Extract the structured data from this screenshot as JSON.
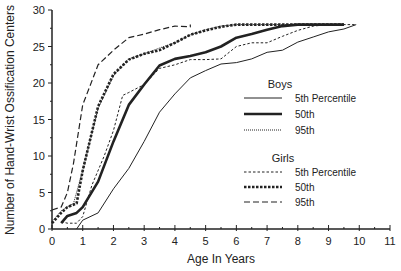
{
  "chart_data": {
    "type": "line",
    "title": "",
    "xlabel": "Age In Years",
    "ylabel": "Number of Hand-Wrist Ossification Centers",
    "xlim": [
      0,
      11
    ],
    "ylim": [
      0,
      30
    ],
    "x_ticks": [
      0,
      1,
      2,
      3,
      4,
      5,
      6,
      7,
      8,
      9,
      10,
      11
    ],
    "y_ticks": [
      0,
      5,
      10,
      15,
      20,
      25,
      30
    ],
    "grid": false,
    "legend": {
      "position": "right-center",
      "groups": [
        {
          "title": "Boys",
          "entries": [
            "5th Percentile",
            "50th",
            "95th"
          ]
        },
        {
          "title": "Girls",
          "entries": [
            "5th Percentile",
            "50th",
            "95th"
          ]
        }
      ]
    },
    "series": [
      {
        "name": "Boys 5th Percentile",
        "group": "Boys",
        "style": "solid-thin",
        "points": [
          [
            0.8,
            0
          ],
          [
            1.0,
            1.2
          ],
          [
            1.5,
            2.2
          ],
          [
            2.0,
            5.5
          ],
          [
            2.5,
            8.3
          ],
          [
            3.0,
            12.0
          ],
          [
            3.5,
            16.0
          ],
          [
            4.0,
            18.5
          ],
          [
            4.5,
            20.7
          ],
          [
            5.0,
            21.7
          ],
          [
            5.5,
            22.6
          ],
          [
            6.0,
            22.8
          ],
          [
            6.5,
            23.3
          ],
          [
            7.0,
            24.2
          ],
          [
            7.5,
            24.5
          ],
          [
            8.0,
            25.6
          ],
          [
            8.5,
            26.3
          ],
          [
            9.0,
            27.0
          ],
          [
            9.5,
            27.4
          ],
          [
            9.9,
            28.0
          ]
        ]
      },
      {
        "name": "Boys 50th",
        "group": "Boys",
        "style": "solid-thick",
        "points": [
          [
            0.3,
            0.8
          ],
          [
            0.5,
            1.8
          ],
          [
            0.8,
            2.2
          ],
          [
            1.0,
            3.0
          ],
          [
            1.5,
            6.5
          ],
          [
            2.0,
            12.0
          ],
          [
            2.5,
            17.0
          ],
          [
            3.0,
            19.8
          ],
          [
            3.5,
            22.4
          ],
          [
            4.0,
            23.3
          ],
          [
            4.5,
            23.7
          ],
          [
            5.0,
            24.2
          ],
          [
            5.5,
            25.0
          ],
          [
            6.0,
            26.2
          ],
          [
            6.5,
            26.7
          ],
          [
            7.0,
            27.3
          ],
          [
            7.5,
            27.8
          ],
          [
            8.0,
            28.0
          ],
          [
            9.0,
            28.0
          ],
          [
            9.5,
            28.0
          ]
        ]
      },
      {
        "name": "Boys 95th",
        "group": "Boys",
        "style": "dotted-thin",
        "points": [
          [
            0.0,
            1.0
          ],
          [
            0.3,
            2.5
          ],
          [
            0.7,
            3.5
          ],
          [
            1.0,
            8.0
          ],
          [
            1.5,
            16.5
          ],
          [
            2.0,
            21.0
          ],
          [
            2.5,
            23.3
          ],
          [
            3.0,
            24.0
          ],
          [
            3.5,
            24.8
          ],
          [
            4.0,
            25.5
          ],
          [
            4.5,
            26.6
          ],
          [
            5.0,
            27.3
          ],
          [
            5.5,
            27.8
          ],
          [
            6.0,
            28.0
          ],
          [
            7.0,
            28.0
          ],
          [
            8.0,
            28.0
          ],
          [
            9.0,
            28.0
          ]
        ]
      },
      {
        "name": "Girls 5th Percentile",
        "group": "Girls",
        "style": "dashed-thin",
        "points": [
          [
            0.3,
            1.0
          ],
          [
            0.5,
            0.8
          ],
          [
            0.8,
            0.8
          ],
          [
            1.0,
            1.7
          ],
          [
            1.3,
            6.0
          ],
          [
            1.7,
            10.0
          ],
          [
            2.0,
            13.5
          ],
          [
            2.3,
            18.3
          ],
          [
            2.5,
            18.7
          ],
          [
            3.0,
            19.8
          ],
          [
            3.5,
            22.0
          ],
          [
            4.0,
            22.5
          ],
          [
            4.5,
            23.2
          ],
          [
            5.0,
            23.2
          ],
          [
            5.5,
            23.3
          ],
          [
            6.0,
            25.0
          ],
          [
            6.5,
            25.5
          ],
          [
            7.0,
            25.5
          ],
          [
            7.5,
            26.4
          ],
          [
            8.0,
            27.2
          ],
          [
            8.5,
            27.8
          ],
          [
            9.0,
            28.0
          ],
          [
            9.5,
            28.0
          ],
          [
            9.9,
            28.0
          ]
        ]
      },
      {
        "name": "Girls 50th",
        "group": "Girls",
        "style": "dashed-thick",
        "points": [
          [
            0.0,
            0.8
          ],
          [
            0.3,
            2.2
          ],
          [
            0.5,
            3.0
          ],
          [
            0.8,
            3.5
          ],
          [
            1.0,
            8.0
          ],
          [
            1.5,
            16.8
          ],
          [
            2.0,
            21.2
          ],
          [
            2.5,
            23.2
          ],
          [
            3.0,
            24.0
          ],
          [
            3.5,
            24.5
          ],
          [
            4.0,
            25.5
          ],
          [
            4.5,
            26.6
          ],
          [
            5.0,
            27.2
          ],
          [
            5.5,
            27.7
          ],
          [
            6.0,
            28.0
          ],
          [
            7.0,
            28.0
          ],
          [
            8.0,
            28.0
          ],
          [
            9.0,
            28.0
          ],
          [
            9.5,
            28.0
          ]
        ]
      },
      {
        "name": "Girls 95th",
        "group": "Girls",
        "style": "long-dashed",
        "points": [
          [
            0.0,
            2.6
          ],
          [
            0.3,
            3.0
          ],
          [
            0.5,
            5.0
          ],
          [
            0.7,
            9.0
          ],
          [
            1.0,
            17.0
          ],
          [
            1.5,
            22.5
          ],
          [
            2.0,
            24.5
          ],
          [
            2.5,
            26.2
          ],
          [
            3.0,
            26.7
          ],
          [
            3.5,
            27.3
          ],
          [
            4.0,
            27.8
          ],
          [
            4.5,
            27.7
          ],
          [
            4.5,
            28.0
          ]
        ]
      }
    ]
  },
  "colors": {
    "ink": "#222222",
    "background": "#ffffff"
  }
}
